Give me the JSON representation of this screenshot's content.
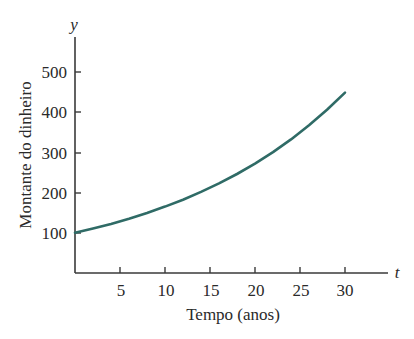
{
  "chart_data": {
    "type": "line",
    "title": "",
    "xlabel": "Tempo (anos)",
    "ylabel": "Montante do dinheiro",
    "x_axis_var": "t",
    "y_axis_var": "y",
    "xlim": [
      0,
      35
    ],
    "ylim": [
      0,
      560
    ],
    "x_ticks": [
      5,
      10,
      15,
      20,
      25,
      30
    ],
    "y_ticks": [
      100,
      200,
      300,
      400,
      500
    ],
    "grid": false,
    "legend": null,
    "series": [
      {
        "name": "y = 100 e^(0.05t)",
        "color": "#2f6b66",
        "x": [
          0,
          2,
          4,
          6,
          8,
          10,
          12,
          14,
          16,
          18,
          20,
          22,
          24,
          26,
          28,
          30
        ],
        "values": [
          100,
          110.5,
          122.1,
          135.0,
          149.2,
          164.9,
          182.2,
          201.4,
          222.6,
          246.0,
          271.8,
          300.4,
          332.0,
          366.9,
          405.5,
          448.2
        ]
      }
    ]
  },
  "labels": {
    "x_ticks": [
      "5",
      "10",
      "15",
      "20",
      "25",
      "30"
    ],
    "y_ticks": [
      "100",
      "200",
      "300",
      "400",
      "500"
    ],
    "xlabel": "Tempo (anos)",
    "ylabel": "Montante do dinheiro",
    "x_var": "t",
    "y_var": "y"
  }
}
